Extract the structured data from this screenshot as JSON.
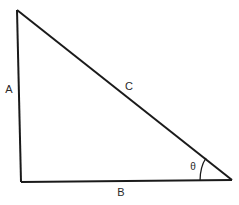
{
  "diagram": {
    "type": "right-triangle",
    "stroke_color": "#1a1a1a",
    "vertices": {
      "top": [
        17,
        10
      ],
      "right_angle": [
        21,
        182
      ],
      "acute": [
        232,
        180
      ]
    },
    "sides": {
      "vertical": {
        "label": "A",
        "pos": [
          9,
          89
        ]
      },
      "hypotenuse": {
        "label": "C",
        "pos": [
          129,
          86
        ]
      },
      "base": {
        "label": "B",
        "pos": [
          121,
          192
        ]
      }
    },
    "angle": {
      "label": "θ",
      "pos": [
        193,
        167
      ],
      "vertex": "acute"
    }
  }
}
